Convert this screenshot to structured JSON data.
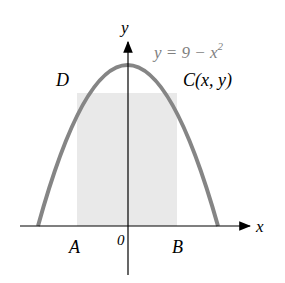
{
  "diagram": {
    "equation_label": "y = 9 − x",
    "equation_exponent": "2",
    "axis_labels": {
      "x": "x",
      "y": "y"
    },
    "origin_label": "0",
    "points": {
      "D": "D",
      "C": "C(x, y)",
      "A": "A",
      "B": "B"
    },
    "colors": {
      "curve": "#808080",
      "rect_fill": "#e8e8e8",
      "axis": "#000000",
      "equation": "#808080"
    }
  }
}
